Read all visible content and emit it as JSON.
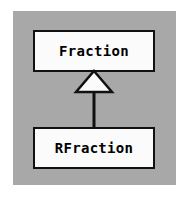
{
  "diagram": {
    "type": "uml-class-diagram",
    "background_color": "#ffffff",
    "panel_color": "#a8a8a8",
    "box_fill_color": "#fbfbfb",
    "line_color": "#111111",
    "classes": [
      {
        "id": "fraction",
        "name": "Fraction",
        "role": "superclass"
      },
      {
        "id": "rfraction",
        "name": "RFraction",
        "role": "subclass"
      }
    ],
    "relationships": [
      {
        "type": "generalization",
        "from": "RFraction",
        "to": "Fraction",
        "arrow": "hollow-triangle",
        "label": ""
      }
    ]
  }
}
